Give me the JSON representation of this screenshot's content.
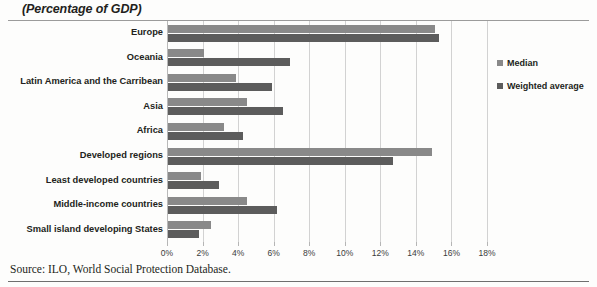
{
  "chart_data": {
    "type": "bar",
    "orientation": "horizontal",
    "title": "(Percentage of GDP)",
    "xlabel": "",
    "ylabel": "",
    "xlim": [
      0,
      18
    ],
    "xticks": [
      "0%",
      "2%",
      "4%",
      "6%",
      "8%",
      "10%",
      "12%",
      "14%",
      "16%",
      "18%"
    ],
    "xtick_values": [
      0,
      2,
      4,
      6,
      8,
      10,
      12,
      14,
      16,
      18
    ],
    "grid": true,
    "legend_position": "right",
    "categories": [
      "Europe",
      "Oceania",
      "Latin America and the Carribean",
      "Asia",
      "Africa",
      "Developed regions",
      "Least developed countries",
      "Middle-income countries",
      "Small island developing States"
    ],
    "series": [
      {
        "name": "Median",
        "color": "#898989",
        "values": [
          15.1,
          2.1,
          3.9,
          4.5,
          3.2,
          14.9,
          1.9,
          4.5,
          2.5
        ]
      },
      {
        "name": "Weighted average",
        "color": "#5c5c5c",
        "values": [
          15.3,
          6.9,
          5.9,
          6.5,
          4.3,
          12.7,
          2.9,
          6.2,
          1.8
        ]
      }
    ]
  },
  "legend": {
    "items": [
      {
        "label": "Median",
        "color": "#898989"
      },
      {
        "label": "Weighted average",
        "color": "#5c5c5c"
      }
    ]
  },
  "source": {
    "text": "Source: ILO, World Social Protection Database."
  }
}
